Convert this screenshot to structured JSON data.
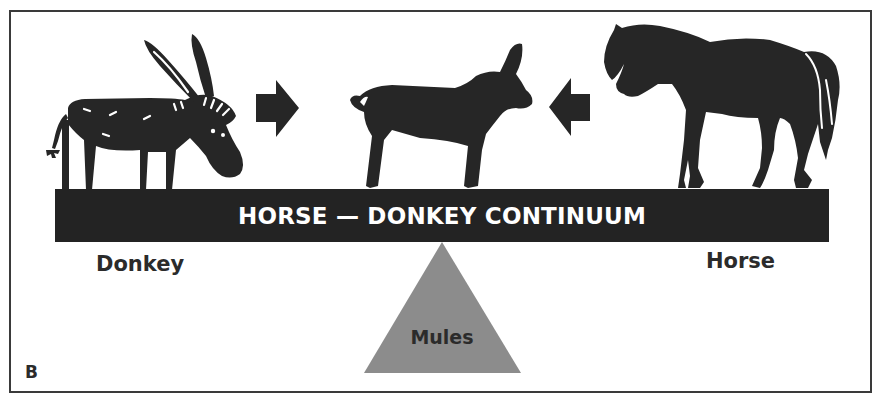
{
  "figure": {
    "panel_letter": "B",
    "bar_title": "HORSE — DONKEY CONTINUUM",
    "labels": {
      "left": "Donkey",
      "right": "Horse",
      "fulcrum": "Mules"
    },
    "icons": {
      "left_animal": "donkey-silhouette",
      "center_animal": "mule-foal-silhouette",
      "right_animal": "horse-silhouette",
      "left_arrow": "arrow-right",
      "right_arrow": "arrow-left"
    },
    "colors": {
      "bar": "#232323",
      "bar_text": "#ffffff",
      "silhouettes": "#262626",
      "fulcrum": "#8c8c8c",
      "labels": "#2b2b2b",
      "frame": "#3a3a3a"
    }
  }
}
